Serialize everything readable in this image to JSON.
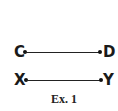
{
  "segments": [
    {
      "start_label": "C",
      "end_label": "D"
    },
    {
      "start_label": "X",
      "end_label": "Y"
    }
  ],
  "caption": "Ex. 1"
}
